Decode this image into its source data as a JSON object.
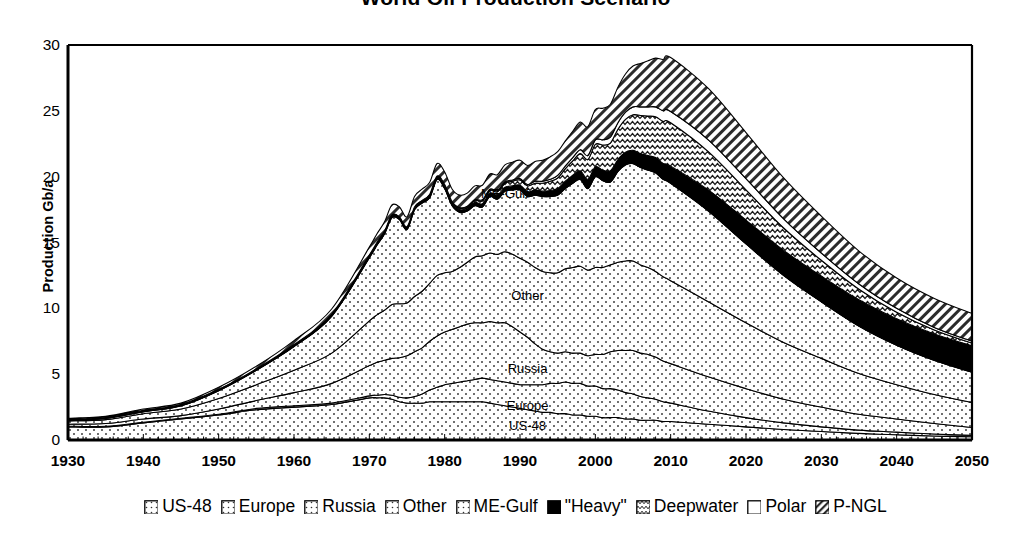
{
  "chart": {
    "title": "World Oil Production Scenario",
    "ylabel": "Production Gb/a",
    "xlabel": "",
    "yticks": [
      "30",
      "25",
      "20",
      "15",
      "10",
      "5",
      "0"
    ],
    "xticks": [
      "1930",
      "1940",
      "1950",
      "1960",
      "1970",
      "1980",
      "1990",
      "2000",
      "2010",
      "2020",
      "2030",
      "2040",
      "2050"
    ],
    "inline_labels": [
      {
        "text": "ME-Gulf"
      },
      {
        "text": "Other"
      },
      {
        "text": "Russia"
      },
      {
        "text": "Europe"
      },
      {
        "text": "US-48"
      }
    ]
  },
  "legend": {
    "items": [
      {
        "label": "US-48",
        "pattern": "dots"
      },
      {
        "label": "Europe",
        "pattern": "dots"
      },
      {
        "label": "Russia",
        "pattern": "dots"
      },
      {
        "label": "Other",
        "pattern": "dots"
      },
      {
        "label": "ME-Gulf",
        "pattern": "dots"
      },
      {
        "label": "\"Heavy\"",
        "pattern": "solid-black"
      },
      {
        "label": "Deepwater",
        "pattern": "wavy"
      },
      {
        "label": "Polar",
        "pattern": "white"
      },
      {
        "label": "P-NGL",
        "pattern": "diagonal-hatch"
      }
    ]
  },
  "chart_data": {
    "type": "area",
    "stacked": true,
    "title": "World Oil Production Scenario",
    "xlabel": "",
    "ylabel": "Production Gb/a",
    "xlim": [
      1930,
      2050
    ],
    "ylim": [
      0,
      30
    ],
    "grid": false,
    "legend_position": "bottom",
    "x": [
      1930,
      1935,
      1940,
      1945,
      1950,
      1955,
      1960,
      1965,
      1970,
      1971,
      1972,
      1973,
      1974,
      1975,
      1976,
      1977,
      1978,
      1979,
      1980,
      1981,
      1982,
      1983,
      1984,
      1985,
      1986,
      1987,
      1988,
      1989,
      1990,
      1991,
      1992,
      1993,
      1994,
      1995,
      1996,
      1997,
      1998,
      1999,
      2000,
      2001,
      2002,
      2003,
      2004,
      2005,
      2006,
      2007,
      2008,
      2009,
      2010,
      2015,
      2020,
      2025,
      2030,
      2035,
      2040,
      2045,
      2050
    ],
    "series": [
      {
        "name": "US-48",
        "pattern": "dots",
        "values": [
          1.0,
          1.0,
          1.3,
          1.6,
          1.9,
          2.3,
          2.5,
          2.7,
          3.2,
          3.2,
          3.2,
          3.1,
          2.9,
          2.8,
          2.8,
          2.8,
          2.9,
          2.9,
          2.9,
          2.9,
          2.9,
          2.9,
          2.9,
          2.9,
          2.8,
          2.7,
          2.6,
          2.5,
          2.4,
          2.3,
          2.2,
          2.1,
          2.1,
          2.0,
          2.0,
          1.9,
          1.9,
          1.8,
          1.8,
          1.7,
          1.7,
          1.7,
          1.6,
          1.6,
          1.5,
          1.5,
          1.5,
          1.4,
          1.4,
          1.2,
          1.0,
          0.8,
          0.65,
          0.5,
          0.4,
          0.3,
          0.25
        ]
      },
      {
        "name": "Europe",
        "pattern": "dots",
        "values": [
          0.05,
          0.05,
          0.05,
          0.05,
          0.05,
          0.1,
          0.1,
          0.1,
          0.15,
          0.2,
          0.25,
          0.3,
          0.35,
          0.4,
          0.5,
          0.7,
          0.9,
          1.1,
          1.3,
          1.4,
          1.5,
          1.6,
          1.7,
          1.8,
          1.8,
          1.8,
          1.8,
          1.8,
          1.8,
          1.9,
          2.0,
          2.1,
          2.2,
          2.3,
          2.4,
          2.4,
          2.4,
          2.3,
          2.3,
          2.2,
          2.2,
          2.1,
          2.0,
          1.9,
          1.8,
          1.7,
          1.6,
          1.5,
          1.4,
          1.0,
          0.7,
          0.5,
          0.35,
          0.25,
          0.2,
          0.15,
          0.1
        ]
      },
      {
        "name": "Russia",
        "pattern": "dots",
        "values": [
          0.15,
          0.2,
          0.25,
          0.2,
          0.4,
          0.6,
          1.0,
          1.5,
          2.3,
          2.5,
          2.6,
          2.8,
          3.0,
          3.2,
          3.4,
          3.5,
          3.7,
          3.9,
          4.0,
          4.1,
          4.2,
          4.3,
          4.3,
          4.2,
          4.4,
          4.4,
          4.5,
          4.3,
          4.0,
          3.6,
          3.1,
          2.7,
          2.4,
          2.3,
          2.3,
          2.3,
          2.3,
          2.3,
          2.4,
          2.6,
          2.8,
          3.0,
          3.2,
          3.3,
          3.3,
          3.3,
          3.2,
          3.1,
          3.0,
          2.6,
          2.2,
          1.8,
          1.5,
          1.2,
          1.0,
          0.8,
          0.6
        ]
      },
      {
        "name": "Other",
        "pattern": "dots",
        "values": [
          0.25,
          0.3,
          0.4,
          0.5,
          0.8,
          1.2,
          1.7,
          2.3,
          3.4,
          3.6,
          3.8,
          4.1,
          4.1,
          4.0,
          4.2,
          4.3,
          4.4,
          4.6,
          4.5,
          4.4,
          4.5,
          4.7,
          5.0,
          5.1,
          5.2,
          5.2,
          5.4,
          5.5,
          5.6,
          5.7,
          5.8,
          5.9,
          6.0,
          6.1,
          6.3,
          6.5,
          6.6,
          6.5,
          6.6,
          6.6,
          6.6,
          6.7,
          6.8,
          6.8,
          6.7,
          6.6,
          6.5,
          6.4,
          6.3,
          5.7,
          5.0,
          4.3,
          3.7,
          3.1,
          2.6,
          2.2,
          1.9
        ]
      },
      {
        "name": "ME-Gulf",
        "pattern": "dots",
        "values": [
          0.05,
          0.1,
          0.15,
          0.25,
          0.6,
          1.1,
          1.8,
          2.8,
          4.8,
          5.3,
          5.8,
          6.6,
          6.4,
          5.6,
          6.6,
          6.7,
          6.5,
          7.3,
          6.4,
          5.0,
          4.2,
          3.9,
          3.9,
          3.7,
          4.3,
          4.2,
          4.6,
          4.9,
          5.2,
          5.0,
          5.5,
          5.7,
          5.8,
          5.9,
          6.1,
          6.4,
          6.6,
          6.2,
          6.9,
          6.6,
          6.3,
          6.9,
          7.3,
          7.4,
          7.4,
          7.4,
          7.5,
          7.4,
          7.4,
          6.9,
          6.0,
          5.1,
          4.3,
          3.6,
          3.0,
          2.6,
          2.3
        ]
      },
      {
        "name": "\"Heavy\"",
        "pattern": "solid-black",
        "values": [
          0.1,
          0.1,
          0.1,
          0.1,
          0.1,
          0.1,
          0.15,
          0.15,
          0.2,
          0.2,
          0.2,
          0.2,
          0.2,
          0.2,
          0.2,
          0.2,
          0.2,
          0.2,
          0.2,
          0.2,
          0.2,
          0.2,
          0.25,
          0.25,
          0.25,
          0.3,
          0.3,
          0.3,
          0.35,
          0.35,
          0.4,
          0.4,
          0.45,
          0.5,
          0.55,
          0.6,
          0.65,
          0.7,
          0.75,
          0.8,
          0.85,
          0.9,
          0.95,
          1.0,
          1.05,
          1.1,
          1.15,
          1.2,
          1.3,
          1.6,
          1.8,
          1.9,
          1.95,
          2.0,
          2.0,
          2.0,
          2.0
        ]
      },
      {
        "name": "Deepwater",
        "pattern": "wavy",
        "values": [
          0,
          0,
          0,
          0,
          0,
          0,
          0,
          0,
          0,
          0,
          0,
          0,
          0,
          0,
          0,
          0,
          0.05,
          0.05,
          0.05,
          0.05,
          0.1,
          0.1,
          0.15,
          0.2,
          0.2,
          0.25,
          0.3,
          0.35,
          0.4,
          0.45,
          0.5,
          0.6,
          0.7,
          0.8,
          0.95,
          1.1,
          1.3,
          1.5,
          1.7,
          1.9,
          2.1,
          2.3,
          2.5,
          2.7,
          2.9,
          3.0,
          3.1,
          3.2,
          3.3,
          2.9,
          2.3,
          1.7,
          1.2,
          0.8,
          0.5,
          0.3,
          0.2
        ]
      },
      {
        "name": "Polar",
        "pattern": "white",
        "values": [
          0,
          0,
          0,
          0,
          0,
          0,
          0,
          0,
          0,
          0,
          0,
          0,
          0,
          0,
          0,
          0,
          0,
          0,
          0.05,
          0.05,
          0.05,
          0.05,
          0.05,
          0.1,
          0.1,
          0.1,
          0.1,
          0.1,
          0.1,
          0.1,
          0.15,
          0.15,
          0.15,
          0.2,
          0.2,
          0.25,
          0.3,
          0.3,
          0.35,
          0.4,
          0.45,
          0.5,
          0.55,
          0.6,
          0.65,
          0.7,
          0.75,
          0.8,
          0.85,
          0.9,
          0.85,
          0.7,
          0.55,
          0.4,
          0.3,
          0.2,
          0.15
        ]
      },
      {
        "name": "P-NGL",
        "pattern": "diagonal-hatch",
        "values": [
          0.05,
          0.05,
          0.1,
          0.1,
          0.15,
          0.2,
          0.3,
          0.4,
          0.6,
          0.65,
          0.7,
          0.75,
          0.75,
          0.75,
          0.8,
          0.85,
          0.9,
          0.95,
          0.95,
          0.95,
          0.95,
          1.0,
          1.05,
          1.1,
          1.15,
          1.2,
          1.3,
          1.35,
          1.4,
          1.45,
          1.5,
          1.6,
          1.7,
          1.8,
          1.9,
          2.0,
          2.1,
          2.2,
          2.3,
          2.4,
          2.5,
          2.7,
          2.9,
          3.1,
          3.3,
          3.5,
          3.7,
          3.9,
          4.1,
          3.9,
          3.5,
          3.1,
          2.8,
          2.5,
          2.3,
          2.2,
          2.1
        ]
      }
    ]
  }
}
